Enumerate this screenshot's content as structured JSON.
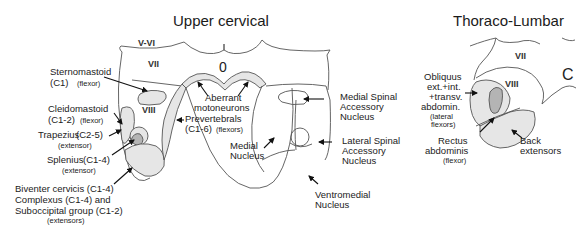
{
  "figure": {
    "panels": [
      {
        "title": "Upper cervical",
        "laminae": [
          "V-VI",
          "VII",
          "VIII"
        ],
        "central_canal_glyph": "0",
        "left_labels": [
          {
            "name": "Sternomastoid",
            "segments": "(C1)",
            "role": "(flexor)"
          },
          {
            "name": "Cleidomastoid",
            "segments": "(C1-2)",
            "role": "(flexor)"
          },
          {
            "name": "Trapezius",
            "segments": "(C2-5)",
            "role": "(extensor)"
          },
          {
            "name": "Splenius",
            "segments": "(C1-4)",
            "role": "(extensor)"
          },
          {
            "lines": [
              "Biventer cervicis (C1-4)",
              "Complexus (C1-4) and",
              "Suboccipital group (C1-2)"
            ],
            "role": "(extensors)"
          }
        ],
        "center_labels": {
          "aberrant": [
            "Aberrant",
            "motoneurons"
          ],
          "prevertebrals": {
            "name": "Prevertebrals",
            "segments": "(C1-6)",
            "role": "(flexors)"
          },
          "medial": [
            "Medial",
            "Nucleus"
          ],
          "ventromedial": [
            "Ventromedial",
            "Nucleus"
          ]
        },
        "right_labels": {
          "medial_spinal_accessory": [
            "Medial Spinal",
            "Accessory",
            "Nucleus"
          ],
          "lateral_spinal_accessory": [
            "Lateral Spinal",
            "Accessory",
            "Nucleus"
          ]
        }
      },
      {
        "title": "Thoraco-Lumbar",
        "laminae": [
          "VII",
          "VIII"
        ],
        "central_canal_glyph": "C",
        "labels": {
          "obliquus": [
            "Obliquus",
            "ext.+int.",
            "+transv.",
            "abdomin.",
            "(lateral",
            "flexors)"
          ],
          "rectus": [
            "Rectus",
            "abdominis",
            "(flexor)"
          ],
          "back": [
            "Back",
            "extensors"
          ]
        }
      }
    ]
  },
  "colors": {
    "pool_fill": "#e6e6e6",
    "pool_dark_fill": "#b4b4b4",
    "outline": "#555555",
    "text": "#222222"
  }
}
